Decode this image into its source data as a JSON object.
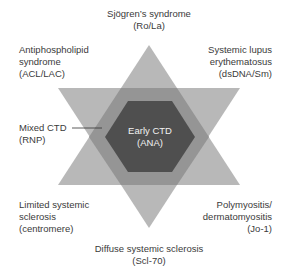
{
  "diagram": {
    "type": "star-of-david overlap diagram",
    "colors": {
      "triangle": "#b8b8b8",
      "overlap": "#959595",
      "center": "#4f4f4f",
      "center_text": "#f2f2f2",
      "text": "#3a3a3a"
    },
    "center": {
      "line1": "Early CTD",
      "line2": "(ANA)"
    },
    "top": {
      "line1": "Sjögren’s syndrome",
      "line2": "(Ro/La)"
    },
    "top_left": {
      "line1": "Antiphospholipid",
      "line2": "syndrome",
      "line3": "(ACL/LAC)"
    },
    "top_right": {
      "line1": "Systemic lupus",
      "line2": "erythematosus",
      "line3": "(dsDNA/Sm)"
    },
    "left": {
      "line1": "Mixed CTD",
      "line2": "(RNP)"
    },
    "bottom_left": {
      "line1": "Limited systemic",
      "line2": "sclerosis",
      "line3": "(centromere)"
    },
    "bottom_right": {
      "line1": "Polymyositis/",
      "line2": "dermatomyositis",
      "line3": "(Jo-1)"
    },
    "bottom": {
      "line1": "Diffuse systemic sclerosis",
      "line2": "(Scl-70)"
    }
  }
}
